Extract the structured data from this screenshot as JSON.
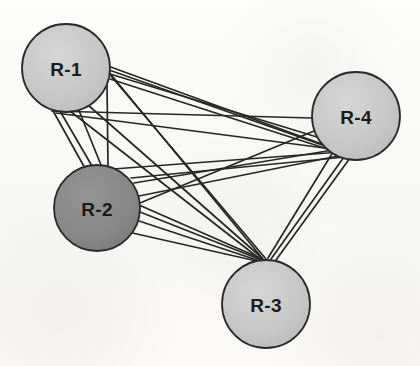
{
  "diagram": {
    "title": "",
    "type": "node-link-multigraph",
    "background_color": "#fbfbfa",
    "edge_color": "#262626",
    "edge_width": 1.7,
    "node_stroke_color": "#2b2b2b",
    "node_stroke_width": 1.8,
    "nodes": [
      {
        "id": "R-1",
        "label": "R-1",
        "cx": 66,
        "cy": 68,
        "r": 44,
        "fill": "#c9c9c9",
        "label_color": "#1b1b1b"
      },
      {
        "id": "R-2",
        "label": "R-2",
        "cx": 97,
        "cy": 208,
        "r": 43,
        "fill": "#8a8a8a",
        "label_color": "#111111"
      },
      {
        "id": "R-3",
        "label": "R-3",
        "cx": 266,
        "cy": 304,
        "r": 44,
        "fill": "#cbcbcb",
        "label_color": "#1b1b1b"
      },
      {
        "id": "R-4",
        "label": "R-4",
        "cx": 356,
        "cy": 116,
        "r": 44,
        "fill": "#c9c9c9",
        "label_color": "#1b1b1b"
      }
    ],
    "anchors": {
      "R1_right": {
        "x": 108,
        "y": 68
      },
      "R1_lower_right": {
        "x": 103,
        "y": 92
      },
      "R1_bottom": {
        "x": 64,
        "y": 112
      },
      "R1_bottom_right": {
        "x": 88,
        "y": 103
      },
      "R2_top": {
        "x": 99,
        "y": 165
      },
      "R2_right": {
        "x": 140,
        "y": 210
      },
      "R2_upper_right": {
        "x": 132,
        "y": 180
      },
      "R3_top": {
        "x": 265,
        "y": 260
      },
      "R4_left": {
        "x": 312,
        "y": 120
      },
      "R4_lower_left": {
        "x": 330,
        "y": 148
      },
      "R4_bottom_left": {
        "x": 343,
        "y": 156
      }
    },
    "edges": [
      {
        "from": "R-1",
        "to": "R-4",
        "multiplicity": 5
      },
      {
        "from": "R-1",
        "to": "R-3",
        "multiplicity": 4
      },
      {
        "from": "R-1",
        "to": "R-2",
        "multiplicity": 4
      },
      {
        "from": "R-2",
        "to": "R-4",
        "multiplicity": 5
      },
      {
        "from": "R-2",
        "to": "R-3",
        "multiplicity": 4
      },
      {
        "from": "R-3",
        "to": "R-4",
        "multiplicity": 3
      }
    ],
    "edge_segments": [
      {
        "name": "R1-R4-a",
        "x1": 108,
        "y1": 66,
        "x2": 341,
        "y2": 151
      },
      {
        "name": "R1-R4-b",
        "x1": 109,
        "y1": 70,
        "x2": 345,
        "y2": 153
      },
      {
        "name": "R1-R4-c",
        "x1": 110,
        "y1": 74,
        "x2": 317,
        "y2": 137
      },
      {
        "name": "R1-R4-d",
        "x1": 52,
        "y1": 111,
        "x2": 312,
        "y2": 118
      },
      {
        "name": "R1-R4-e",
        "x1": 56,
        "y1": 113,
        "x2": 340,
        "y2": 150
      },
      {
        "name": "R1-R4-f",
        "x1": 110,
        "y1": 79,
        "x2": 343,
        "y2": 154
      },
      {
        "name": "R1-R3-a",
        "x1": 108,
        "y1": 71,
        "x2": 263,
        "y2": 259
      },
      {
        "name": "R1-R3-b",
        "x1": 111,
        "y1": 76,
        "x2": 266,
        "y2": 259
      },
      {
        "name": "R1-R3-c",
        "x1": 88,
        "y1": 105,
        "x2": 262,
        "y2": 258
      },
      {
        "name": "R1-R3-d",
        "x1": 70,
        "y1": 111,
        "x2": 260,
        "y2": 259
      },
      {
        "name": "R1-R2-a",
        "x1": 60,
        "y1": 111,
        "x2": 92,
        "y2": 166
      },
      {
        "name": "R1-R2-b",
        "x1": 78,
        "y1": 108,
        "x2": 101,
        "y2": 165
      },
      {
        "name": "R1-R2-c",
        "x1": 107,
        "y1": 83,
        "x2": 108,
        "y2": 167
      },
      {
        "name": "R1-R2-d",
        "x1": 52,
        "y1": 109,
        "x2": 86,
        "y2": 170
      },
      {
        "name": "R2-R4-a",
        "x1": 134,
        "y1": 183,
        "x2": 339,
        "y2": 149
      },
      {
        "name": "R2-R4-b",
        "x1": 139,
        "y1": 196,
        "x2": 343,
        "y2": 155
      },
      {
        "name": "R2-R4-c",
        "x1": 140,
        "y1": 203,
        "x2": 314,
        "y2": 131
      },
      {
        "name": "R2-R4-d",
        "x1": 131,
        "y1": 178,
        "x2": 345,
        "y2": 157
      },
      {
        "name": "R2-R4-e",
        "x1": 113,
        "y1": 169,
        "x2": 341,
        "y2": 152
      },
      {
        "name": "R2-R3-a",
        "x1": 139,
        "y1": 205,
        "x2": 262,
        "y2": 259
      },
      {
        "name": "R2-R3-b",
        "x1": 140,
        "y1": 212,
        "x2": 264,
        "y2": 261
      },
      {
        "name": "R2-R3-c",
        "x1": 136,
        "y1": 220,
        "x2": 263,
        "y2": 262
      },
      {
        "name": "R2-R3-d",
        "x1": 128,
        "y1": 232,
        "x2": 261,
        "y2": 262
      },
      {
        "name": "R3-R4-a",
        "x1": 271,
        "y1": 259,
        "x2": 344,
        "y2": 157
      },
      {
        "name": "R3-R4-b",
        "x1": 276,
        "y1": 260,
        "x2": 350,
        "y2": 158
      },
      {
        "name": "R3-R4-c",
        "x1": 268,
        "y1": 258,
        "x2": 333,
        "y2": 152
      }
    ]
  }
}
